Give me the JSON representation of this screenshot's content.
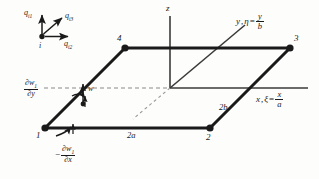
{
  "figure": {
    "type": "finite-element-plate-dof-diagram",
    "background_color": "#fdfdfc",
    "line_color": "#1a1a1a"
  },
  "dof_legend": {
    "node_label": "i",
    "arrows": [
      {
        "name": "q_i1",
        "label_main": "q",
        "label_sub": "i1",
        "direction": "up"
      },
      {
        "name": "q_i3",
        "label_main": "q",
        "label_sub": "i3",
        "direction": "up-right-diagonal"
      },
      {
        "name": "q_i2",
        "label_main": "q",
        "label_sub": "i2",
        "direction": "right"
      }
    ]
  },
  "axes": {
    "z": {
      "label": "z"
    },
    "y": {
      "label_main": "y",
      "eta": "η",
      "equals": "=",
      "num": "y",
      "den": "b"
    },
    "x": {
      "label_main": "x",
      "xi": "ξ",
      "equals": "=",
      "num": "x",
      "den": "a"
    }
  },
  "nodes": [
    {
      "id": "1",
      "label": "1"
    },
    {
      "id": "2",
      "label": "2"
    },
    {
      "id": "3",
      "label": "3"
    },
    {
      "id": "4",
      "label": "4"
    }
  ],
  "dimensions": [
    {
      "name": "2a",
      "label": "2a"
    },
    {
      "name": "2b",
      "label": "2b"
    }
  ],
  "annotations": {
    "deflection": {
      "label": "w"
    },
    "rotation_y": {
      "sign": "",
      "num_d": "∂w",
      "num_sub": "1",
      "den": "∂y"
    },
    "rotation_x": {
      "sign": "−",
      "num_d": "∂w",
      "num_sub": "1",
      "den": "∂x"
    }
  }
}
